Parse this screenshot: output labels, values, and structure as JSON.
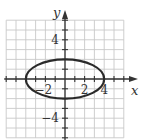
{
  "figure": {
    "type": "graph-of-ellipse",
    "equation": "x^2/16 + y^2/4 = 1",
    "center": [
      0,
      0
    ],
    "semi_axis_x": 4,
    "semi_axis_y": 2,
    "grid": {
      "xmin": -6,
      "xmax": 6,
      "ymin": -6,
      "ymax": 6,
      "step": 1
    },
    "axes": {
      "x_label": "x",
      "y_label": "y"
    },
    "x_tick_labels": [
      {
        "value": -2,
        "text": "−2"
      },
      {
        "value": 2,
        "text": "2"
      },
      {
        "value": 4,
        "text": "4"
      }
    ],
    "y_tick_labels": [
      {
        "value": 4,
        "text": "4"
      },
      {
        "value": -4,
        "text": "−4"
      }
    ],
    "colors": {
      "grid": "#c8c8c8",
      "axis": "#333333",
      "curve": "#2a2a2a"
    }
  }
}
